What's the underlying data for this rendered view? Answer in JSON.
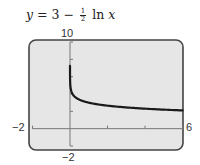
{
  "title": {
    "lhs": "y",
    "eq": " = 3 − ",
    "frac_num": "1",
    "frac_den": "2",
    "fn": " ln ",
    "var": "x"
  },
  "window_labels": {
    "ymax": "10",
    "ymin": "−2",
    "xmin": "−2",
    "xmax": "6"
  },
  "colors": {
    "screen_bg": "#e6e6e6",
    "frame": "#444444",
    "axis": "#777777",
    "curve": "#1a1a1a"
  },
  "chart_data": {
    "type": "line",
    "xlabel": "",
    "ylabel": "",
    "xlim": [
      -2,
      6
    ],
    "ylim": [
      -2,
      10
    ],
    "x_ticks": [
      2,
      4,
      6
    ],
    "y_ticks": [
      2,
      4,
      6,
      8
    ],
    "grid": false,
    "series": [
      {
        "name": "y = 3 - 0.5 ln x",
        "x": [
          0.0002,
          0.001,
          0.01,
          0.05,
          0.1,
          0.25,
          0.5,
          1,
          2,
          3,
          4,
          5,
          6
        ],
        "values": [
          7.26,
          6.45,
          5.3,
          4.5,
          4.15,
          3.69,
          3.35,
          3.0,
          2.65,
          2.45,
          2.31,
          2.2,
          2.1
        ]
      }
    ]
  }
}
